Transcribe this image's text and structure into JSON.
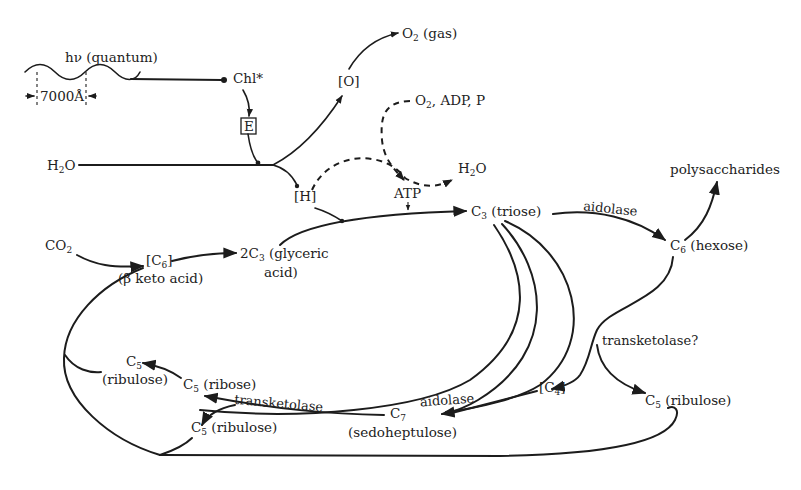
{
  "diagram": {
    "type": "photosynthesis-carbon-cycle",
    "colors": {
      "ink": "#1c1c1c",
      "background": "#ffffff"
    },
    "nodes": {
      "light": {
        "label": "hν (quantum)",
        "wavelength": "7000Å"
      },
      "chl": {
        "label": "Chl*"
      },
      "e": {
        "label": "E"
      },
      "o": {
        "label": "[O]"
      },
      "o2gas": {
        "main": "O",
        "sub": "2",
        "suffix": " (gas)"
      },
      "water_in": {
        "main": "H",
        "sub": "2",
        "suffix": "O"
      },
      "h": {
        "label": "[H]"
      },
      "o2adp": {
        "main": "O",
        "sub": "2",
        "suffix": ", ADP, P"
      },
      "water_out": {
        "main": "H",
        "sub": "2",
        "suffix": "O"
      },
      "atp": {
        "label": "ATP"
      },
      "co2": {
        "main": "CO",
        "sub": "2"
      },
      "c6_keto": {
        "main": "[C",
        "sub": "6",
        "suffix": "]",
        "line2": "(β keto acid)"
      },
      "glyceric": {
        "main": "2C",
        "sub": "3",
        "suffix": " (glyceric",
        "line2": "acid)"
      },
      "triose": {
        "main": "C",
        "sub": "3",
        "suffix": " (triose)"
      },
      "hexose": {
        "main": "C",
        "sub": "6",
        "suffix": " (hexose)"
      },
      "polysaccharides": {
        "label": "polysaccharides"
      },
      "c4": {
        "main": "[C",
        "sub": "4",
        "suffix": "]"
      },
      "c5_ribulose_right": {
        "main": "C",
        "sub": "5",
        "suffix": " (ribulose)"
      },
      "c7": {
        "main": "C",
        "sub": "7",
        "line2": "(sedoheptulose)"
      },
      "c5_ribose": {
        "main": "C",
        "sub": "5",
        "suffix": " (ribose)"
      },
      "c5_ribulose_top": {
        "main": "C",
        "sub": "5",
        "line2": "(ribulose)"
      },
      "c5_ribulose_bottom": {
        "main": "C",
        "sub": "5",
        "suffix": " (ribulose)"
      }
    },
    "enzymes": {
      "aldolase_top": "aidolase",
      "aldolase_bottom": "aidolase",
      "transketolase_left": "transketolase",
      "transketolase_right": "transketolase?"
    },
    "edges": [
      {
        "from": "light",
        "to": "chl"
      },
      {
        "from": "chl",
        "to": "e"
      },
      {
        "from": "e",
        "to": "water_split"
      },
      {
        "from": "water_in",
        "to": "o"
      },
      {
        "from": "o",
        "to": "o2gas"
      },
      {
        "from": "water_in",
        "to": "h"
      },
      {
        "from": "h",
        "to": "water_out",
        "style": "dashed"
      },
      {
        "from": "o2adp",
        "to": "atp",
        "style": "dashed"
      },
      {
        "from": "h",
        "to": "triose"
      },
      {
        "from": "atp",
        "to": "triose"
      },
      {
        "from": "co2",
        "to": "c6_keto"
      },
      {
        "from": "c6_keto",
        "to": "glyceric"
      },
      {
        "from": "glyceric",
        "to": "triose"
      },
      {
        "from": "triose",
        "to": "hexose",
        "label": "aidolase"
      },
      {
        "from": "hexose",
        "to": "polysaccharides"
      },
      {
        "from": "hexose",
        "to": "c4",
        "label": "transketolase?"
      },
      {
        "from": "hexose",
        "to": "c5_ribulose_right",
        "label": "transketolase?"
      },
      {
        "from": "triose",
        "to": "c7",
        "label": "aidolase"
      },
      {
        "from": "c4",
        "to": "c7"
      },
      {
        "from": "c7",
        "to": "c5_ribose",
        "label": "transketolase"
      },
      {
        "from": "c7",
        "to": "c5_ribulose_bottom",
        "label": "transketolase"
      },
      {
        "from": "c5_ribose",
        "to": "c5_ribulose_top"
      },
      {
        "from": "c5_ribulose_top",
        "to": "c6_keto"
      },
      {
        "from": "c5_ribulose_bottom",
        "to": "c6_keto"
      },
      {
        "from": "c5_ribulose_right",
        "to": "c6_keto"
      }
    ]
  }
}
